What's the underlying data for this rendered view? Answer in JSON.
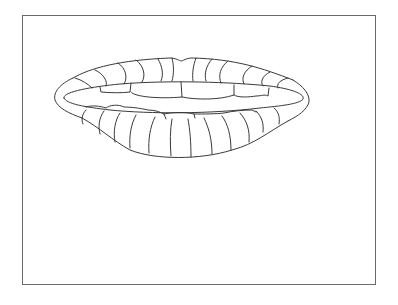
{
  "illustration": {
    "subject": "lips-line-drawing",
    "style": "coloring-page outline",
    "stroke_color": "#3a3a3a",
    "frame_color": "#6a6a6a",
    "background": "#ffffff"
  }
}
